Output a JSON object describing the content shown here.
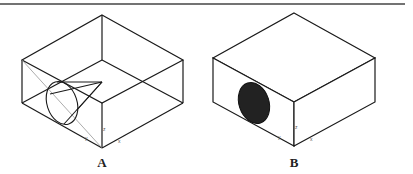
{
  "figures": [
    {
      "id": "A",
      "label": "A",
      "description": "Wireframe isometric box with cone inside",
      "axis_labels": {
        "z": "z",
        "x": "x",
        "y": "y"
      }
    },
    {
      "id": "B",
      "label": "B",
      "description": "Solid isometric box with elliptical hole on left face",
      "axis_labels": {
        "z": "z",
        "x": "x",
        "y": "y"
      }
    }
  ],
  "colors": {
    "stroke": "#1a1a1a",
    "rule": "#444444",
    "thin_line": "#888888",
    "hole_fill": "#111111"
  }
}
